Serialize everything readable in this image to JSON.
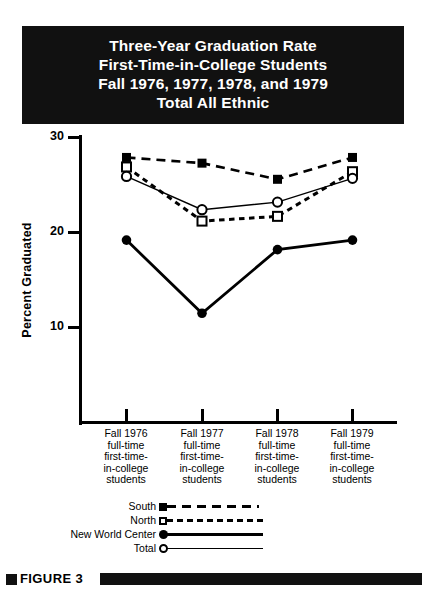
{
  "title": {
    "lines": [
      "Three-Year Graduation Rate",
      "First-Time-in-College Students",
      "Fall 1976, 1977, 1978, and 1979",
      "Total All Ethnic"
    ]
  },
  "figure": {
    "bullet_icon": "black-square-bullet",
    "label": "FIGURE 3"
  },
  "axes": {
    "ylabel": "Percent Graduated",
    "yticks": [
      "30",
      "20",
      "10"
    ],
    "ytick_values": [
      30,
      20,
      10
    ],
    "ylim": [
      7.5,
      30
    ],
    "grid": false
  },
  "categories_multiline": [
    [
      "Fall 1976",
      "full-time",
      "first-time-",
      "in-college",
      "students"
    ],
    [
      "Fall 1977",
      "full-time",
      "first-time-",
      "in-college",
      "students"
    ],
    [
      "Fall 1978",
      "full-time",
      "first-time-",
      "in-college",
      "students"
    ],
    [
      "Fall 1979",
      "full-time",
      "first-time-",
      "in-college",
      "students"
    ]
  ],
  "legend": {
    "position": "below-plot",
    "items": [
      {
        "label": "South",
        "marker": "filled-square",
        "line": "long-dash"
      },
      {
        "label": "North",
        "marker": "open-square",
        "line": "short-dash"
      },
      {
        "label": "New World Center",
        "marker": "filled-circle",
        "line": "solid-thick"
      },
      {
        "label": "Total",
        "marker": "open-circle",
        "line": "solid-thin"
      }
    ]
  },
  "colors": {
    "ink": "#000000",
    "banner": "#111111",
    "paper": "#ffffff"
  },
  "chart_data": {
    "type": "line",
    "title": "Three-Year Graduation Rate First-Time-in-College Students Fall 1976, 1977, 1978, and 1979 Total All Ethnic",
    "xlabel": "",
    "ylabel": "Percent Graduated",
    "categories": [
      "Fall 1976",
      "Fall 1977",
      "Fall 1978",
      "Fall 1979"
    ],
    "ylim": [
      7.5,
      30
    ],
    "yticks": [
      10,
      20,
      30
    ],
    "grid": false,
    "legend_position": "below-plot",
    "series": [
      {
        "name": "South",
        "marker": "filled-square",
        "line": "long-dash",
        "values": [
          27.9,
          27.3,
          25.6,
          27.9
        ]
      },
      {
        "name": "North",
        "marker": "open-square",
        "line": "short-dash",
        "values": [
          26.9,
          21.2,
          21.7,
          26.4
        ]
      },
      {
        "name": "New World Center",
        "marker": "filled-circle",
        "line": "solid-thick",
        "values": [
          19.2,
          11.5,
          18.2,
          19.2
        ]
      },
      {
        "name": "Total",
        "marker": "open-circle",
        "line": "solid-thin",
        "values": [
          25.9,
          22.4,
          23.2,
          25.7
        ]
      }
    ]
  }
}
